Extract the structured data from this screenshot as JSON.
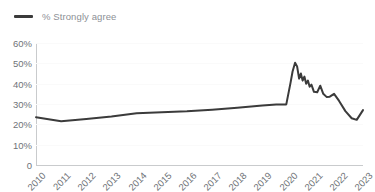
{
  "legend": {
    "marker_name": "line-swatch",
    "label": "% Strongly agree",
    "color": "#3b3b3b",
    "label_color": "#8d9096",
    "position": "top-left"
  },
  "axes": {
    "y_ticks": [
      "60%",
      "50%",
      "40%",
      "30%",
      "20%",
      "10%",
      "0"
    ],
    "x_ticks": [
      "2010",
      "2011",
      "2012",
      "2013",
      "2014",
      "2015",
      "2016",
      "2017",
      "2018",
      "2019",
      "2020",
      "2021",
      "2022",
      "2023"
    ],
    "y_min": 0,
    "y_max": 60,
    "x_min": 2010,
    "x_max": 2023,
    "tick_color": "#6f7378",
    "axis_color": "#c9cbcd",
    "grid": true,
    "grid_color": "#fafafa"
  },
  "chart_data": {
    "type": "line",
    "title": "",
    "subtitle": "",
    "xlabel": "",
    "ylabel": "",
    "xlim": [
      2010,
      2023
    ],
    "ylim": [
      0,
      60
    ],
    "grid": true,
    "legend_position": "top-left",
    "series": [
      {
        "name": "% Strongly agree",
        "color": "#3b3b3b",
        "x": [
          2010,
          2011,
          2012,
          2013,
          2014,
          2015,
          2016,
          2017,
          2018,
          2019,
          2019.55,
          2019.75,
          2019.95,
          2020.12,
          2020.2,
          2020.3,
          2020.38,
          2020.46,
          2020.53,
          2020.6,
          2020.67,
          2020.74,
          2020.81,
          2020.88,
          2020.95,
          2021.05,
          2021.18,
          2021.3,
          2021.42,
          2021.55,
          2021.68,
          2021.85,
          2022.05,
          2022.3,
          2022.55,
          2022.75,
          2023.0
        ],
        "y": [
          23.5,
          21.5,
          22.6,
          23.8,
          25.4,
          25.9,
          26.4,
          27.2,
          28.2,
          29.3,
          29.8,
          29.8,
          29.8,
          40.5,
          46.0,
          50.3,
          48.5,
          42.5,
          45.0,
          41.5,
          43.5,
          40.0,
          41.5,
          38.5,
          39.5,
          36.0,
          35.8,
          39.0,
          35.0,
          33.5,
          33.6,
          35.0,
          31.5,
          26.5,
          23.0,
          22.2,
          27.0
        ]
      }
    ]
  }
}
